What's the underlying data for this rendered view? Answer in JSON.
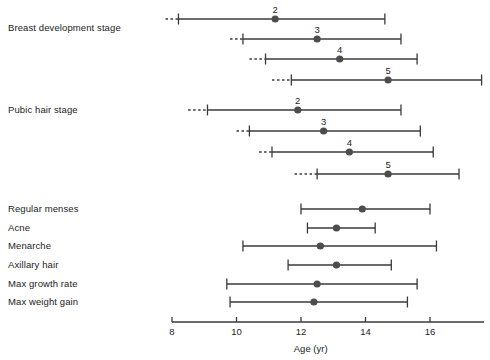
{
  "chart_data": {
    "type": "scatter",
    "title": "",
    "xlabel": "Age (yr)",
    "ylabel": "",
    "xlim": [
      8,
      18
    ],
    "xticks": [
      8,
      10,
      12,
      14,
      16
    ],
    "xtick_labels": [
      "8",
      "10",
      "12",
      "14",
      "16"
    ],
    "grid": false,
    "legend": null,
    "marker_color": "#4d4d4d",
    "line_color": "#3a3a3a",
    "groups": [
      {
        "group_label": "Breast development stage",
        "rows": [
          {
            "stage": "2",
            "mean": 11.2,
            "low": 8.2,
            "high": 14.6,
            "dashed_low": 7.8,
            "has_dashed": true
          },
          {
            "stage": "3",
            "mean": 12.5,
            "low": 10.2,
            "high": 15.1,
            "dashed_low": 9.8,
            "has_dashed": true
          },
          {
            "stage": "4",
            "mean": 13.2,
            "low": 10.9,
            "high": 15.6,
            "dashed_low": 10.4,
            "has_dashed": true
          },
          {
            "stage": "5",
            "mean": 14.7,
            "low": 11.7,
            "high": 17.6,
            "dashed_low": 11.1,
            "has_dashed": true
          }
        ]
      },
      {
        "group_label": "Pubic hair stage",
        "rows": [
          {
            "stage": "2",
            "mean": 11.9,
            "low": 9.1,
            "high": 15.1,
            "dashed_low": 8.5,
            "has_dashed": true
          },
          {
            "stage": "3",
            "mean": 12.7,
            "low": 10.4,
            "high": 15.7,
            "dashed_low": 10.0,
            "has_dashed": true
          },
          {
            "stage": "4",
            "mean": 13.5,
            "low": 11.1,
            "high": 16.1,
            "dashed_low": 10.7,
            "has_dashed": true
          },
          {
            "stage": "5",
            "mean": 14.7,
            "low": 12.5,
            "high": 16.9,
            "dashed_low": 11.8,
            "has_dashed": true
          }
        ]
      }
    ],
    "events": [
      {
        "label": "Regular menses",
        "mean": 13.9,
        "low": 12.0,
        "high": 16.0
      },
      {
        "label": "Acne",
        "mean": 13.1,
        "low": 12.2,
        "high": 14.3
      },
      {
        "label": "Menarche",
        "mean": 12.6,
        "low": 10.2,
        "high": 16.2
      },
      {
        "label": "Axillary hair",
        "mean": 13.1,
        "low": 11.6,
        "high": 14.8
      },
      {
        "label": "Max growth rate",
        "mean": 12.5,
        "low": 9.7,
        "high": 15.6
      },
      {
        "label": "Max weight gain",
        "mean": 12.4,
        "low": 9.8,
        "high": 15.3
      }
    ]
  },
  "axis": {
    "title": "Age (yr)",
    "tick_labels": [
      "8",
      "10",
      "12",
      "14",
      "16"
    ]
  },
  "labels": {
    "breast_group": "Breast development stage",
    "pubic_group": "Pubic hair stage",
    "events": [
      "Regular menses",
      "Acne",
      "Menarche",
      "Axillary hair",
      "Max growth rate",
      "Max weight gain"
    ]
  }
}
